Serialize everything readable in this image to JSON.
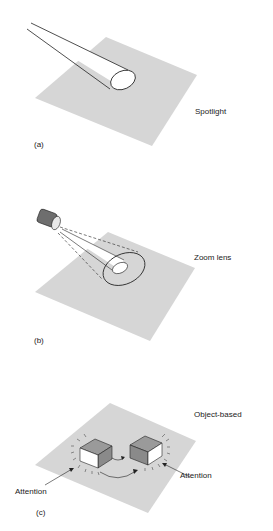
{
  "panels": [
    {
      "id": "a",
      "letter": "(a)",
      "title": "Spotlight"
    },
    {
      "id": "b",
      "letter": "(b)",
      "title": "Zoom lens"
    },
    {
      "id": "c",
      "letter": "(c)",
      "title": "Object-based",
      "annotations": [
        "Attention",
        "Attention"
      ]
    }
  ],
  "colors": {
    "plane": "#d6d6d6",
    "stroke": "#222222",
    "box_top": "#9a9a9a",
    "lens": "#6e6e6e"
  }
}
